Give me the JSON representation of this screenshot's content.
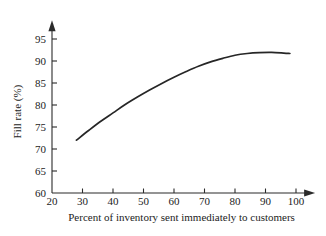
{
  "chart_data": {
    "type": "line",
    "title": "",
    "subtitle": "",
    "xlabel": "Percent of inventory sent immediately to customers",
    "ylabel": "Fill rate (%)",
    "xlim": [
      20,
      103
    ],
    "ylim": [
      60,
      97
    ],
    "xticks": [
      20,
      30,
      40,
      50,
      60,
      70,
      80,
      90,
      100
    ],
    "yticks": [
      60,
      65,
      70,
      75,
      80,
      85,
      90,
      95
    ],
    "xtick_labels": [
      "20",
      "30",
      "40",
      "50",
      "60",
      "70",
      "80",
      "90",
      "100"
    ],
    "ytick_labels": [
      "60",
      "65",
      "70",
      "75",
      "80",
      "85",
      "90",
      "95"
    ],
    "grid": false,
    "legend": false,
    "legend_position": "none",
    "axis_arrows": true,
    "series": [
      {
        "name": "Fill rate",
        "color": "#262626",
        "x": [
          28,
          32,
          36,
          40,
          44,
          48,
          52,
          56,
          60,
          64,
          68,
          72,
          76,
          80,
          84,
          88,
          92,
          96,
          98
        ],
        "y": [
          72.0,
          74.2,
          76.3,
          78.2,
          80.1,
          81.8,
          83.4,
          84.9,
          86.3,
          87.6,
          88.8,
          89.8,
          90.6,
          91.3,
          91.7,
          91.9,
          91.95,
          91.8,
          91.7
        ]
      }
    ],
    "annotations": []
  },
  "figure": {
    "background_color": "#ffffff",
    "ink_color": "#262626",
    "axis_color": "#2b2b2b"
  }
}
